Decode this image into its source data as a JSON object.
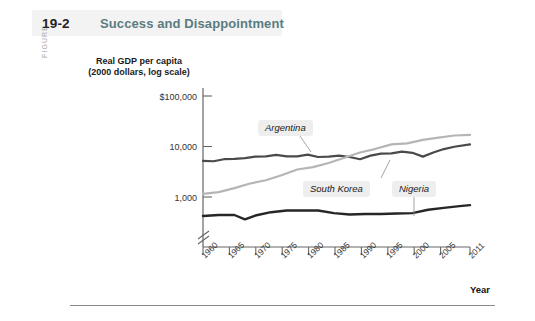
{
  "figure": {
    "kicker": "FIGURE",
    "number": "19-2",
    "title": "Success and Disappointment"
  },
  "chart_data": {
    "type": "line",
    "title": "Success and Disappointment",
    "ylabel": "Real GDP per capita (2000 dollars, log scale)",
    "ylabel_line1": "Real GDP per capita",
    "ylabel_line2": "(2000 dollars, log scale)",
    "xlabel": "Year",
    "grid": false,
    "legend_position": "inline-callouts",
    "log_scale": true,
    "axis_break": true,
    "yticks": [
      "$100,000",
      "10,000",
      "1,000"
    ],
    "ytick_values": [
      100000,
      10000,
      1000
    ],
    "ylim": [
      300,
      100000
    ],
    "xticks": [
      "1960",
      "1965",
      "1970",
      "1975",
      "1980",
      "1985",
      "1990",
      "1995",
      "2000",
      "2005",
      "2011"
    ],
    "xlim": [
      1960,
      2011
    ],
    "series": [
      {
        "name": "Argentina",
        "color": "#4a4a4a",
        "x": [
          1960,
          1962,
          1964,
          1966,
          1968,
          1970,
          1972,
          1974,
          1976,
          1978,
          1980,
          1982,
          1984,
          1986,
          1988,
          1990,
          1992,
          1994,
          1996,
          1998,
          2000,
          2002,
          2004,
          2006,
          2008,
          2011
        ],
        "values": [
          5200,
          5100,
          5600,
          5700,
          5900,
          6300,
          6400,
          6800,
          6400,
          6400,
          6900,
          6200,
          6300,
          6600,
          6200,
          5600,
          6600,
          7200,
          7300,
          7900,
          7500,
          6300,
          7600,
          8900,
          9900,
          11000
        ]
      },
      {
        "name": "South Korea",
        "color": "#b5b5b5",
        "x": [
          1960,
          1963,
          1966,
          1969,
          1972,
          1975,
          1978,
          1981,
          1984,
          1987,
          1990,
          1993,
          1996,
          1999,
          2002,
          2005,
          2008,
          2011
        ],
        "values": [
          1150,
          1250,
          1500,
          1850,
          2150,
          2700,
          3500,
          3900,
          4700,
          6000,
          7600,
          9000,
          11000,
          11500,
          13500,
          15000,
          16500,
          17000
        ]
      },
      {
        "name": "Nigeria",
        "color": "#262626",
        "x": [
          1960,
          1963,
          1966,
          1968,
          1970,
          1973,
          1976,
          1979,
          1982,
          1985,
          1988,
          1991,
          1994,
          1997,
          2000,
          2003,
          2006,
          2009,
          2011
        ],
        "values": [
          420,
          440,
          440,
          360,
          430,
          500,
          540,
          540,
          540,
          480,
          450,
          460,
          460,
          470,
          480,
          560,
          610,
          660,
          690
        ]
      }
    ],
    "annotations": [
      {
        "label": "Argentina",
        "series": "Argentina"
      },
      {
        "label": "South Korea",
        "series": "South Korea"
      },
      {
        "label": "Nigeria",
        "series": "Nigeria"
      }
    ]
  }
}
